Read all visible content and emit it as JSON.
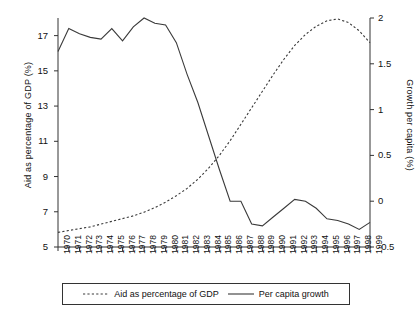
{
  "chart_data": {
    "type": "line",
    "title": "",
    "xlabel": "",
    "ylabel": "Aid as percentage of GDP (%)",
    "y2label": "Growth per capita (%)",
    "grid": false,
    "legend_position": "bottom",
    "x": [
      1970,
      1971,
      1972,
      1973,
      1974,
      1975,
      1976,
      1977,
      1978,
      1979,
      1980,
      1981,
      1982,
      1983,
      1984,
      1985,
      1986,
      1987,
      1988,
      1989,
      1990,
      1991,
      1992,
      1993,
      1994,
      1995,
      1996,
      1997,
      1998,
      1999
    ],
    "xtick_labels": [
      "1970",
      "1971",
      "1972",
      "1973",
      "1974",
      "1975",
      "1976",
      "1977",
      "1978",
      "1979",
      "1980",
      "1981",
      "1982",
      "1983",
      "1984",
      "1985",
      "1986",
      "1987",
      "1988",
      "1989",
      "1990",
      "1991",
      "1992",
      "1993",
      "1994",
      "1995",
      "1996",
      "1997",
      "1998",
      "1999"
    ],
    "xlim": [
      1970,
      1999
    ],
    "ylim": [
      5,
      18
    ],
    "ytick_labels": [
      "5",
      "7",
      "9",
      "11",
      "13",
      "15",
      "17"
    ],
    "yticks": [
      5,
      7,
      9,
      11,
      13,
      15,
      17
    ],
    "y2lim": [
      -0.5,
      2
    ],
    "y2tick_labels": [
      "-0.5",
      "0",
      "0.5",
      "1",
      "1.5",
      "2"
    ],
    "y2ticks": [
      -0.5,
      0,
      0.5,
      1,
      1.5,
      2
    ],
    "series": [
      {
        "name": "Aid as percentage of GDP",
        "axis": "right",
        "style": "dashed",
        "color": "#3a3a3a",
        "values": [
          -0.34,
          -0.32,
          -0.3,
          -0.28,
          -0.25,
          -0.22,
          -0.19,
          -0.16,
          -0.12,
          -0.07,
          -0.01,
          0.06,
          0.14,
          0.24,
          0.36,
          0.5,
          0.66,
          0.84,
          1.02,
          1.2,
          1.38,
          1.55,
          1.7,
          1.82,
          1.91,
          1.97,
          1.99,
          1.95,
          1.86,
          1.73
        ]
      },
      {
        "name": "Per capita growth",
        "axis": "left",
        "style": "solid",
        "color": "#3a3a3a",
        "values": [
          16.1,
          17.4,
          17.1,
          16.9,
          16.8,
          17.4,
          16.7,
          17.5,
          18.0,
          17.7,
          17.6,
          16.6,
          14.8,
          13.2,
          11.3,
          9.4,
          7.6,
          7.6,
          6.3,
          6.2,
          6.7,
          7.2,
          7.7,
          7.6,
          7.2,
          6.6,
          6.5,
          6.3,
          6.0,
          6.4
        ]
      }
    ],
    "growth_right_axis_values": [
      0.05,
      0.3,
      0.25,
      0.22,
      0.21,
      0.3,
      0.19,
      0.31,
      0.41,
      0.36,
      0.35,
      0.22,
      -0.01,
      -0.17,
      -0.39,
      -0.6,
      -0.34,
      -0.34,
      -0.25,
      -0.26,
      -0.17,
      -0.08,
      -0.02,
      -0.03,
      -0.11,
      -0.21,
      -0.23,
      -0.26,
      -0.31,
      -0.23
    ]
  },
  "legend": {
    "entries": [
      {
        "label": "Aid as percentage of GDP",
        "style": "dashed"
      },
      {
        "label": "Per capita growth",
        "style": "solid"
      }
    ]
  }
}
